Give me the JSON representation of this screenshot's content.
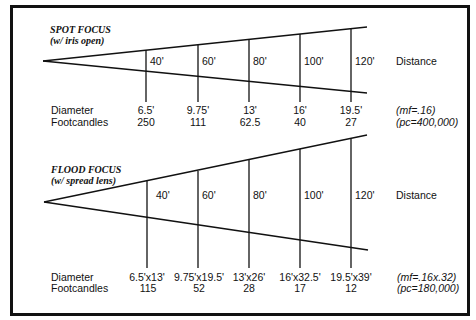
{
  "spot": {
    "title": "SPOT FOCUS",
    "subtitle": "(w/ iris open)",
    "distances": [
      "40'",
      "60'",
      "80'",
      "100'",
      "120'"
    ],
    "distance_label": "Distance",
    "diameter_label": "Diameter",
    "footcandles_label": "Footcandles",
    "diameters": [
      "6.5'",
      "9.75'",
      "13'",
      "16'",
      "19.5'"
    ],
    "footcandles": [
      "250",
      "111",
      "62.5",
      "40",
      "27"
    ],
    "mf_note": "(mf=.16)",
    "pc_note": "(pc=400,000)"
  },
  "flood": {
    "title": "FLOOD FOCUS",
    "subtitle": "(w/ spread lens)",
    "distances": [
      "40'",
      "60'",
      "80'",
      "100'",
      "120'"
    ],
    "distance_label": "Distance",
    "diameter_label": "Diameter",
    "footcandles_label": "Footcandles",
    "diameters": [
      "6.5'x13'",
      "9.75'x19.5'",
      "13'x26'",
      "16'x32.5'",
      "19.5'x39'"
    ],
    "footcandles": [
      "115",
      "52",
      "28",
      "17",
      "12"
    ],
    "mf_note": "(mf=.16x.32)",
    "pc_note": "(pc=180,000)"
  }
}
